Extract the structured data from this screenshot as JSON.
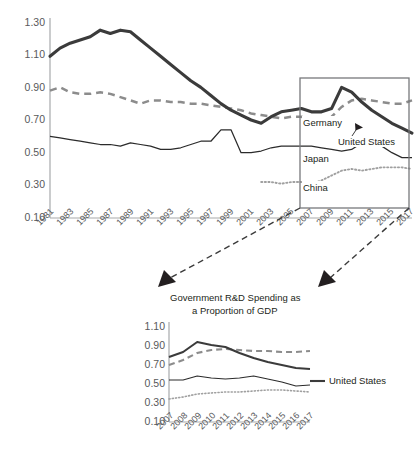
{
  "chart_data": [
    {
      "id": "main",
      "type": "line",
      "title": "",
      "xlabel": "",
      "ylabel": "",
      "ylim": [
        0.1,
        1.3
      ],
      "yticks": [
        "1.30",
        "1.10",
        "0.90",
        "0.70",
        "0.50",
        "0.30",
        "0.10"
      ],
      "ytick_values": [
        1.3,
        1.1,
        0.9,
        0.7,
        0.5,
        0.3,
        0.1
      ],
      "grid": false,
      "legend_position": "inline-labels",
      "x": [
        1981,
        1982,
        1983,
        1984,
        1985,
        1986,
        1987,
        1988,
        1989,
        1990,
        1991,
        1992,
        1993,
        1994,
        1995,
        1996,
        1997,
        1998,
        1999,
        2000,
        2001,
        2002,
        2003,
        2004,
        2005,
        2006,
        2007,
        2008,
        2009,
        2010,
        2011,
        2012,
        2013,
        2014,
        2015,
        2016,
        2017
      ],
      "xtick_labels": [
        "1981",
        "1983",
        "1985",
        "1987",
        "1989",
        "1991",
        "1993",
        "1995",
        "1997",
        "1999",
        "2001",
        "2003",
        "2005",
        "2007",
        "2009",
        "2011",
        "2013",
        "2015",
        "2017"
      ],
      "series": [
        {
          "name": "United States",
          "style": "thick-solid",
          "color": "#3b3b3b",
          "values": [
            1.09,
            1.14,
            1.17,
            1.19,
            1.21,
            1.25,
            1.23,
            1.25,
            1.24,
            1.19,
            1.14,
            1.09,
            1.04,
            0.99,
            0.94,
            0.9,
            0.85,
            0.8,
            0.76,
            0.73,
            0.7,
            0.68,
            0.72,
            0.75,
            0.76,
            0.77,
            0.75,
            0.75,
            0.77,
            0.9,
            0.87,
            0.81,
            0.76,
            0.72,
            0.68,
            0.65,
            0.62
          ]
        },
        {
          "name": "Germany",
          "style": "dashed",
          "color": "#8c8c8c",
          "values": [
            0.88,
            0.9,
            0.87,
            0.86,
            0.86,
            0.87,
            0.86,
            0.84,
            0.82,
            0.8,
            0.82,
            0.82,
            0.81,
            0.81,
            0.8,
            0.8,
            0.79,
            0.78,
            0.77,
            0.76,
            0.74,
            0.73,
            0.72,
            0.71,
            0.72,
            0.72,
            0.7,
            0.68,
            0.72,
            0.78,
            0.82,
            0.83,
            0.82,
            0.81,
            0.8,
            0.8,
            0.82
          ]
        },
        {
          "name": "Japan",
          "style": "thin-solid",
          "color": "#2b2b2b",
          "values": [
            0.6,
            0.59,
            0.58,
            0.57,
            0.56,
            0.55,
            0.55,
            0.54,
            0.56,
            0.55,
            0.54,
            0.52,
            0.52,
            0.53,
            0.55,
            0.57,
            0.57,
            0.64,
            0.64,
            0.5,
            0.5,
            0.51,
            0.53,
            0.54,
            0.54,
            0.54,
            0.54,
            0.53,
            0.52,
            0.51,
            0.52,
            0.56,
            0.56,
            0.54,
            0.5,
            0.47,
            0.47
          ]
        },
        {
          "name": "China",
          "style": "dotted",
          "color": "#a0a0a0",
          "values": [
            null,
            null,
            null,
            null,
            null,
            null,
            null,
            null,
            null,
            null,
            null,
            null,
            null,
            null,
            null,
            null,
            null,
            null,
            null,
            null,
            null,
            0.32,
            0.32,
            0.31,
            0.32,
            0.32,
            0.31,
            0.33,
            0.36,
            0.39,
            0.4,
            0.39,
            0.4,
            0.41,
            0.41,
            0.41,
            0.4
          ]
        }
      ],
      "annotations": [
        {
          "text": "Germany",
          "x": 2007,
          "y": 0.7
        },
        {
          "text": "United States",
          "x": 2010,
          "y": 0.625
        },
        {
          "text": "Japan",
          "x": 2007,
          "y": 0.5
        },
        {
          "text": "China",
          "x": 2007,
          "y": 0.33
        }
      ],
      "highlight_box": {
        "x_from": 2007,
        "x_to": 2017,
        "y_from": 0.19,
        "y_to": 0.955
      }
    },
    {
      "id": "inset",
      "type": "line",
      "title": "Government R&D Spending as a Proportion of GDP",
      "title_line1": "Government R&D Spending as",
      "title_line2": "a Proportion of GDP",
      "xlabel": "",
      "ylabel": "",
      "ylim": [
        0.1,
        1.1
      ],
      "yticks": [
        "1.10",
        "0.90",
        "0.70",
        "0.50",
        "0.30",
        "0.10"
      ],
      "ytick_values": [
        1.1,
        0.9,
        0.7,
        0.5,
        0.3,
        0.1
      ],
      "grid": false,
      "legend_position": "inline-labels",
      "x": [
        2007,
        2008,
        2009,
        2010,
        2011,
        2012,
        2013,
        2014,
        2015,
        2016,
        2017
      ],
      "xtick_labels": [
        "2007",
        "2008",
        "2009",
        "2010",
        "2011",
        "2012",
        "2013",
        "2014",
        "2015",
        "2016",
        "2017"
      ],
      "series": [
        {
          "name": "United States",
          "style": "thick-solid",
          "color": "#3b3b3b",
          "values": [
            0.75,
            0.8,
            0.9,
            0.87,
            0.85,
            0.79,
            0.74,
            0.7,
            0.67,
            0.64,
            0.63
          ]
        },
        {
          "name": "Germany",
          "style": "dashed",
          "color": "#8c8c8c",
          "values": [
            0.67,
            0.72,
            0.79,
            0.82,
            0.83,
            0.82,
            0.81,
            0.81,
            0.8,
            0.8,
            0.81
          ]
        },
        {
          "name": "Japan",
          "style": "thin-solid",
          "color": "#2b2b2b",
          "values": [
            0.52,
            0.52,
            0.56,
            0.54,
            0.53,
            0.54,
            0.56,
            0.53,
            0.5,
            0.46,
            0.47
          ]
        },
        {
          "name": "China",
          "style": "dotted",
          "color": "#a0a0a0",
          "values": [
            0.33,
            0.35,
            0.38,
            0.39,
            0.4,
            0.4,
            0.41,
            0.42,
            0.42,
            0.41,
            0.4
          ]
        }
      ],
      "annotations": [
        {
          "text": "United States",
          "x": 2017,
          "y": 0.63
        }
      ]
    }
  ],
  "colors": {
    "united_states": "#3b3b3b",
    "germany": "#8c8c8c",
    "japan": "#2b2b2b",
    "china": "#a0a0a0",
    "axis": "#a7a9ac",
    "box": "#77787b",
    "text": "#231f20",
    "tick_text": "#58595b"
  }
}
